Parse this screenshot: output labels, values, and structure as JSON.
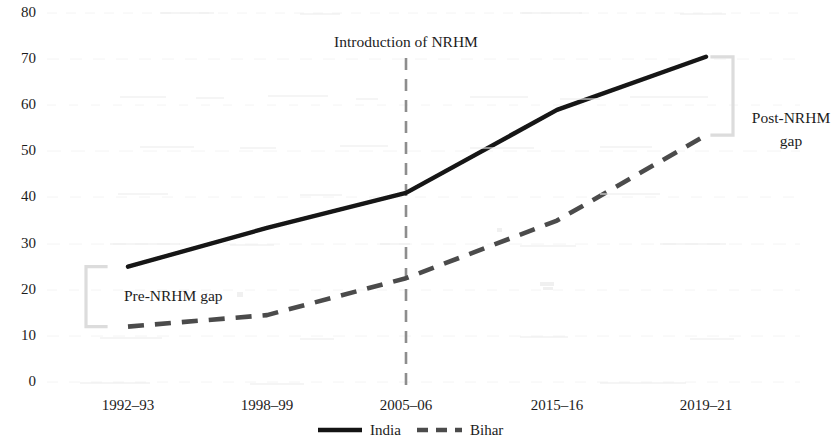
{
  "chart_data": {
    "type": "line",
    "title": "",
    "subtitle": "",
    "xlabel": "",
    "ylabel": "",
    "categories": [
      "1992–93",
      "1998–99",
      "2005–06",
      "2015–16",
      "2019–21"
    ],
    "series": [
      {
        "name": "India",
        "style": "solid",
        "color": "#161616",
        "values": [
          25,
          33.4,
          41,
          59,
          70.5
        ]
      },
      {
        "name": "Bihar",
        "style": "dashed",
        "color": "#4a4a4a",
        "values": [
          12,
          14.5,
          22.5,
          35,
          53.5
        ]
      }
    ],
    "ylim": [
      0,
      80
    ],
    "yticks": [
      0,
      10,
      20,
      30,
      40,
      50,
      60,
      70,
      80
    ],
    "ytick_labels": [
      "0",
      "10",
      "20",
      "30",
      "40",
      "50",
      "60",
      "70",
      "80"
    ],
    "grid": false,
    "legend_position": "bottom",
    "annotations": [
      {
        "id": "nrhm-line",
        "text": "Introduction of NRHM",
        "at_category": "2005–06",
        "type": "vertical-dashed-line"
      },
      {
        "id": "pre-gap",
        "text": "Pre-NRHM gap",
        "at_category": "1992–93",
        "type": "bracket",
        "span": [
          12,
          25
        ]
      },
      {
        "id": "post-gap",
        "text": "Post-NRHM gap",
        "at_category": "2019–21",
        "type": "bracket",
        "span": [
          53.5,
          70.5
        ]
      }
    ]
  },
  "axes": {
    "y_tick_labels": [
      "80",
      "70",
      "60",
      "50",
      "40",
      "30",
      "20",
      "10",
      "0"
    ],
    "x_tick_labels": [
      "1992–93",
      "1998–99",
      "2005–06",
      "2015–16",
      "2019–21"
    ]
  },
  "annotations": {
    "nrhm_intro": "Introduction of NRHM",
    "pre_gap": "Pre-NRHM gap",
    "post_gap_line1": "Post-NRHM",
    "post_gap_line2": "gap"
  },
  "legend": {
    "items": [
      {
        "label": "India",
        "style": "solid"
      },
      {
        "label": "Bihar",
        "style": "dashed"
      }
    ]
  },
  "colors": {
    "india_line": "#161616",
    "bihar_line": "#4a4a4a",
    "bracket": "#d8d8d8",
    "nrhm_dash": "#8a8a8a",
    "text": "#1c1c1c",
    "background": "#ffffff"
  }
}
